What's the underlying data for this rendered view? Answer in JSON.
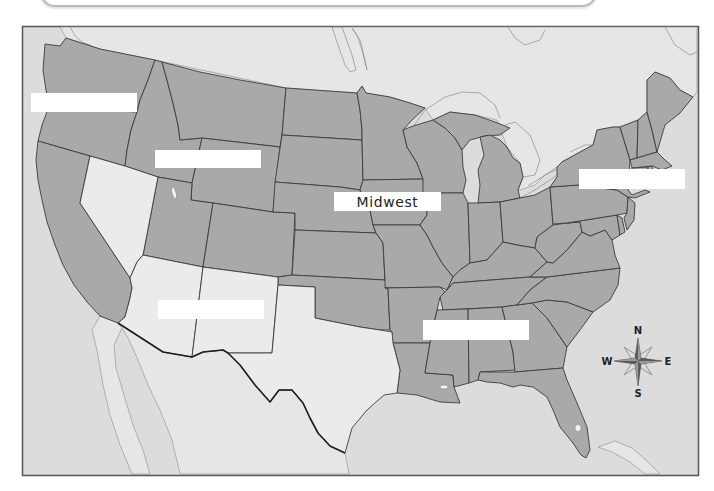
{
  "map": {
    "labels": [
      {
        "text": ""
      },
      {
        "text": ""
      },
      {
        "text": "Midwest"
      },
      {
        "text": ""
      },
      {
        "text": ""
      },
      {
        "text": ""
      }
    ],
    "compass": {
      "n": "N",
      "s": "S",
      "e": "E",
      "w": "W"
    },
    "colors": {
      "ocean": "#dcdcdc",
      "foreign_land": "#e6e6e6",
      "state_fill": "#a9a9a9",
      "highlight_fill": "#ebebeb",
      "border": "#3c3c3c",
      "label_bg": "#ffffff",
      "frame": "#555555"
    }
  }
}
